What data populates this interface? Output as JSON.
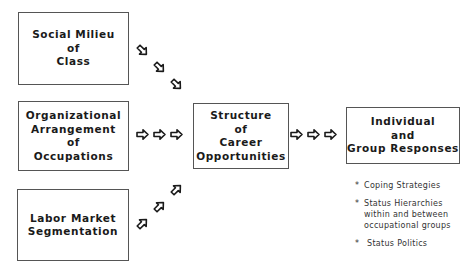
{
  "diagram": {
    "boxes": {
      "social_milieu": {
        "lines": [
          "Social Milieu",
          "of",
          "Class"
        ]
      },
      "organizational": {
        "lines": [
          "Organizational",
          "Arrangement",
          "of",
          "Occupations"
        ]
      },
      "labor_market": {
        "lines": [
          "Labor Market",
          "Segmentation"
        ]
      },
      "structure": {
        "lines": [
          "Structure",
          "of",
          "Career",
          "Opportunities"
        ]
      },
      "responses": {
        "lines": [
          "Individual",
          "and",
          "Group Responses"
        ]
      }
    },
    "notes": {
      "bullet": "*",
      "items": [
        {
          "lines": [
            "Coping Strategies"
          ]
        },
        {
          "lines": [
            "Status Hierarchies",
            "within and between",
            "occupational groups"
          ]
        },
        {
          "lines": [
            "Status Politics"
          ]
        }
      ]
    },
    "colors": {
      "stroke": "#1a1a1a",
      "border": "#555555",
      "background": "#ffffff"
    }
  }
}
